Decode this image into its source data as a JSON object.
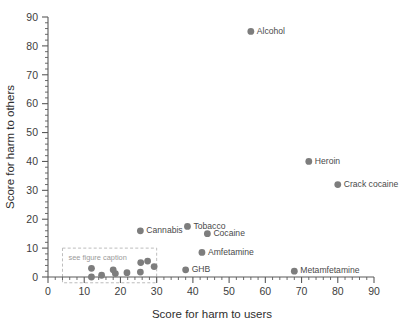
{
  "chart_data": {
    "type": "scatter",
    "title": "",
    "xlabel": "Score for harm to users",
    "ylabel": "Score for harm to others",
    "xlim": [
      0,
      90
    ],
    "ylim": [
      0,
      90
    ],
    "xticks": [
      0,
      10,
      20,
      30,
      40,
      50,
      60,
      70,
      80,
      90
    ],
    "yticks": [
      0,
      10,
      20,
      30,
      40,
      50,
      60,
      70,
      80,
      90
    ],
    "minor_tick_interval": 2,
    "grid": false,
    "legend": null,
    "marker_color": "#7d7d7d",
    "axis_color": "#5a5a5a",
    "annotation_box": {
      "label": "see figure caption",
      "x_range": [
        4,
        30
      ],
      "y_range": [
        -2,
        10
      ],
      "style": "dashed"
    },
    "points": [
      {
        "label": "Alcohol",
        "x": 56,
        "y": 85
      },
      {
        "label": "Heroin",
        "x": 72,
        "y": 40
      },
      {
        "label": "Crack cocaine",
        "x": 80,
        "y": 32
      },
      {
        "label": "Metamfetamine",
        "x": 68,
        "y": 2
      },
      {
        "label": "Cannabis",
        "x": 25.5,
        "y": 16
      },
      {
        "label": "Tobacco",
        "x": 38.5,
        "y": 17.5
      },
      {
        "label": "Cocaine",
        "x": 44,
        "y": 15
      },
      {
        "label": "Amfetamine",
        "x": 42.5,
        "y": 8.5
      },
      {
        "label": "GHB",
        "x": 38,
        "y": 2.5
      },
      {
        "label": "",
        "x": 12,
        "y": 3
      },
      {
        "label": "",
        "x": 12,
        "y": 0
      },
      {
        "label": "",
        "x": 14.8,
        "y": 0.6
      },
      {
        "label": "",
        "x": 18,
        "y": 2.5
      },
      {
        "label": "",
        "x": 18.6,
        "y": 1.2
      },
      {
        "label": "",
        "x": 21.8,
        "y": 1.5
      },
      {
        "label": "",
        "x": 25.6,
        "y": 5
      },
      {
        "label": "",
        "x": 25.5,
        "y": 1.7
      },
      {
        "label": "",
        "x": 27.5,
        "y": 5.5
      },
      {
        "label": "",
        "x": 29.3,
        "y": 3.6
      }
    ]
  },
  "tick_labels": {
    "x": [
      "0",
      "10",
      "20",
      "30",
      "40",
      "50",
      "60",
      "70",
      "80",
      "90"
    ],
    "y": [
      "0",
      "10",
      "20",
      "30",
      "40",
      "50",
      "60",
      "70",
      "80",
      "90"
    ]
  }
}
